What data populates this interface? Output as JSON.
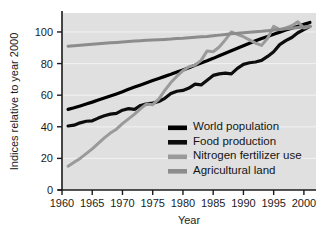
{
  "chart_data": {
    "type": "line",
    "title": "",
    "xlabel": "Year",
    "ylabel": "Indices relative to year 2000",
    "xlim": [
      1960,
      2002
    ],
    "ylim": [
      0,
      112
    ],
    "xticks": [
      1960,
      1965,
      1970,
      1975,
      1980,
      1985,
      1990,
      1995,
      2000
    ],
    "yticks": [
      0,
      20,
      40,
      60,
      80,
      100
    ],
    "grid": "horizontal-light",
    "legend_position": "inside-lower-right",
    "plot_background": "#e0e0e0",
    "x": [
      1961,
      1962,
      1963,
      1964,
      1965,
      1966,
      1967,
      1968,
      1969,
      1970,
      1971,
      1972,
      1973,
      1974,
      1975,
      1976,
      1977,
      1978,
      1979,
      1980,
      1981,
      1982,
      1983,
      1984,
      1985,
      1986,
      1987,
      1988,
      1989,
      1990,
      1991,
      1992,
      1993,
      1994,
      1995,
      1996,
      1997,
      1998,
      1999,
      2000,
      2001
    ],
    "series": [
      {
        "name": "World population",
        "color": "#000000",
        "width": 3.2,
        "values": [
          51.0,
          52.0,
          53.2,
          54.4,
          55.6,
          56.9,
          58.2,
          59.5,
          60.8,
          62.2,
          63.7,
          65.1,
          66.5,
          67.9,
          69.3,
          70.6,
          71.9,
          73.2,
          74.6,
          76.0,
          77.4,
          78.9,
          80.4,
          81.8,
          83.3,
          84.9,
          86.5,
          88.1,
          89.7,
          91.3,
          92.9,
          94.4,
          95.8,
          97.2,
          98.6,
          99.9,
          101.2,
          102.4,
          103.6,
          104.8,
          106.0
        ]
      },
      {
        "name": "Food production",
        "color": "#0d0d0d",
        "width": 3.2,
        "values": [
          40.5,
          41.0,
          42.5,
          43.5,
          43.8,
          45.5,
          47.0,
          48.0,
          48.5,
          50.5,
          51.5,
          51.0,
          53.5,
          54.5,
          55.0,
          56.0,
          58.0,
          61.0,
          62.5,
          63.0,
          64.5,
          67.0,
          66.5,
          69.5,
          72.5,
          73.5,
          74.0,
          73.5,
          77.0,
          79.5,
          80.5,
          81.0,
          82.0,
          84.5,
          87.5,
          92.0,
          94.5,
          96.5,
          99.5,
          101.5,
          103.5
        ]
      },
      {
        "name": "Nitrogen fertilizer use",
        "color": "#9a9a9a",
        "width": 3.0,
        "values": [
          15.0,
          17.5,
          20.0,
          23.0,
          26.0,
          29.5,
          33.0,
          36.0,
          38.5,
          42.0,
          45.0,
          48.0,
          51.5,
          54.5,
          54.0,
          57.5,
          63.0,
          68.0,
          72.0,
          75.5,
          78.0,
          79.0,
          82.0,
          88.0,
          87.5,
          90.5,
          95.0,
          100.0,
          98.5,
          97.0,
          95.0,
          93.0,
          91.5,
          96.0,
          103.5,
          101.5,
          102.5,
          104.0,
          106.5,
          102.5,
          103.5
        ]
      },
      {
        "name": "Agricultural land",
        "color": "#8c8c8c",
        "width": 3.0,
        "values": [
          91.0,
          91.3,
          91.6,
          91.9,
          92.2,
          92.5,
          92.8,
          93.1,
          93.4,
          93.7,
          94.0,
          94.3,
          94.5,
          94.7,
          94.9,
          95.1,
          95.3,
          95.5,
          95.8,
          96.0,
          96.3,
          96.6,
          96.9,
          97.2,
          97.6,
          98.0,
          98.4,
          98.8,
          99.2,
          99.5,
          99.8,
          100.1,
          100.4,
          100.8,
          101.2,
          101.6,
          102.0,
          102.4,
          102.8,
          103.2,
          103.6
        ]
      }
    ]
  },
  "legend": {
    "entries": [
      {
        "label": "World population",
        "color": "#000000"
      },
      {
        "label": "Food production",
        "color": "#0d0d0d"
      },
      {
        "label": "Nitrogen fertilizer use",
        "color": "#9a9a9a"
      },
      {
        "label": "Agricultural land",
        "color": "#8c8c8c"
      }
    ]
  },
  "axes": {
    "x_title": "Year",
    "y_title": "Indices relative to year 2000",
    "x_tick_labels": [
      "1960",
      "1965",
      "1970",
      "1975",
      "1980",
      "1985",
      "1990",
      "1995",
      "2000"
    ],
    "y_tick_labels": [
      "0",
      "20",
      "40",
      "60",
      "80",
      "100"
    ]
  }
}
